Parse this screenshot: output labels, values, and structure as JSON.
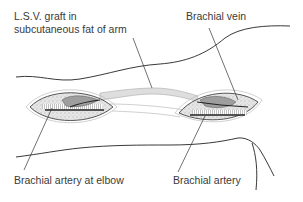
{
  "labels": {
    "lsv_graft_line1": "L.S.V. graft in",
    "lsv_graft_line2": "subcutaneous fat of arm",
    "brachial_vein": "Brachial vein",
    "brachial_artery_elbow": "Brachial artery at elbow",
    "brachial_artery": "Brachial artery"
  },
  "colors": {
    "outline": "#333333",
    "fat": "#e4e4e4",
    "vein": "#9a9a9a",
    "graft": "#d9d9d9",
    "text": "#3a3a3a"
  }
}
